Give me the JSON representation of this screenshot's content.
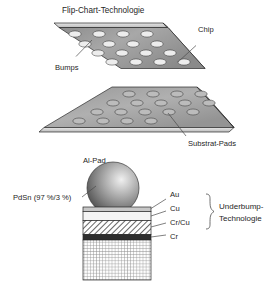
{
  "figure": {
    "title": "Flip-Chart-Technologie",
    "language": "de"
  },
  "upper_assembly": {
    "chip": {
      "label": "Chip",
      "bumps_label": "Bumps",
      "bump_count": 20,
      "bump_rows": 4,
      "bump_cols": 5,
      "face_fill": "#9b9b9b",
      "edge_fill": "#d6d6d6",
      "bump_fill": "#ececec"
    },
    "substrate": {
      "label": "Substrat-Pads",
      "pad_count": 20,
      "pad_rows": 4,
      "pad_cols": 5,
      "face_fill": "#a2a2a2",
      "edge_fill": "#dcdcdc",
      "pad_fill": "#bdbdbd"
    }
  },
  "cross_section": {
    "al_pad_label": "Al-Pad",
    "solder_label": "PdSn (97 %/3 %)",
    "bracket_label_line1": "Underbump-",
    "bracket_label_line2": "Technologie",
    "sphere": {
      "name": "solder-bump-sphere",
      "fill_light": "#e8e8e8",
      "fill_dark": "#4e4e4e"
    },
    "layers": [
      {
        "name": "au",
        "label": "Au",
        "fill": "#c9c9c9",
        "pattern": "solid"
      },
      {
        "name": "cu",
        "label": "Cu",
        "fill": "#f2f2f2",
        "pattern": "solid"
      },
      {
        "name": "cr-cu",
        "label": "Cr/Cu",
        "fill": "#ffffff",
        "pattern": "diagonal-hatch"
      },
      {
        "name": "cr",
        "label": "Cr",
        "fill": "#2f2f2f",
        "pattern": "solid"
      },
      {
        "name": "al-pad",
        "label": "",
        "fill": "#ffffff",
        "pattern": "cross-hatch"
      }
    ]
  },
  "colors": {
    "background": "#ffffff",
    "text": "#262626",
    "leader_line": "#4a4a4a",
    "outline": "#2a2a2a"
  }
}
